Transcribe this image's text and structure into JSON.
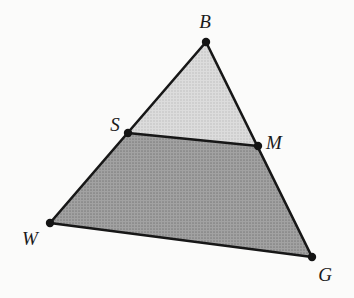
{
  "figure": {
    "width": 354,
    "height": 298,
    "background_color": "#fbfbfa",
    "stroke_color": "#171717",
    "stroke_width": 2.6,
    "vertex_dot_radius": 4.2,
    "vertex_dot_color": "#141414"
  },
  "colors": {
    "upper_fill": "#d2d2d2",
    "lower_fill": "#969696",
    "outline": "#171717",
    "label_text": "#1a1a1a"
  },
  "points": {
    "B": {
      "label": "B",
      "x": 206,
      "y": 42,
      "label_x": 205,
      "label_y": 21
    },
    "W": {
      "label": "W",
      "x": 50,
      "y": 223,
      "label_x": 30,
      "label_y": 238
    },
    "G": {
      "label": "G",
      "x": 312,
      "y": 257,
      "label_x": 325,
      "label_y": 274
    },
    "S": {
      "label": "S",
      "x": 128,
      "y": 133,
      "label_x": 115,
      "label_y": 124
    },
    "M": {
      "label": "M",
      "x": 258,
      "y": 146,
      "label_x": 274,
      "label_y": 142
    }
  },
  "regions": {
    "upper_triangle": {
      "name": "triangle-BSM",
      "vertices": [
        "B",
        "S",
        "M"
      ],
      "fill": "#d2d2d2",
      "polygon_points": "206,42 128,133 258,146"
    },
    "lower_trapezoid": {
      "name": "trapezoid-SWGM",
      "vertices": [
        "S",
        "W",
        "G",
        "M"
      ],
      "fill": "#969696",
      "polygon_points": "128,133 50,223 312,257 258,146"
    }
  },
  "segments": [
    {
      "name": "segment-B-W",
      "from": "B",
      "to": "W",
      "x1": 206,
      "y1": 42,
      "x2": 50,
      "y2": 223
    },
    {
      "name": "segment-B-G",
      "from": "B",
      "to": "G",
      "x1": 206,
      "y1": 42,
      "x2": 312,
      "y2": 257
    },
    {
      "name": "segment-W-G",
      "from": "W",
      "to": "G",
      "x1": 50,
      "y1": 223,
      "x2": 312,
      "y2": 257
    },
    {
      "name": "segment-S-M",
      "from": "S",
      "to": "M",
      "x1": 128,
      "y1": 133,
      "x2": 258,
      "y2": 146
    }
  ]
}
